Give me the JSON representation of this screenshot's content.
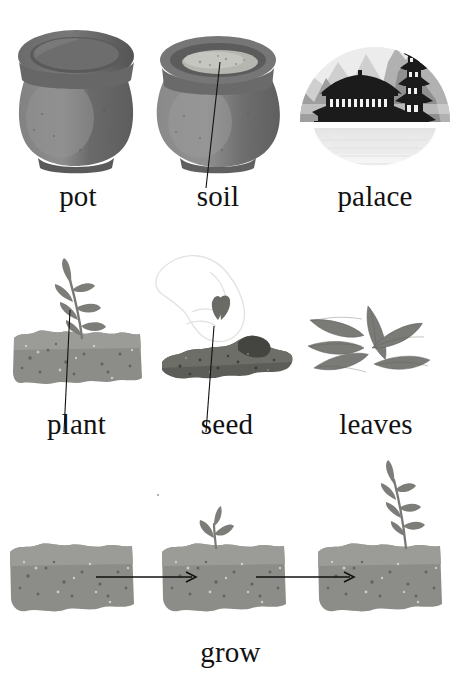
{
  "page": {
    "type": "picture-vocabulary-sheet",
    "background_color": "#ffffff",
    "text_color": "#111111",
    "rows": 3,
    "term_count": 7
  },
  "palette": {
    "soil_light": "#8b8b87",
    "soil_light_top": "#9a9a96",
    "soil_dark": "#585854",
    "soil_dark_top": "#6b6b66",
    "pot_body": "#6f6f6f",
    "pot_body_light": "#848484",
    "pot_rim": "#5e5e5e",
    "pot_rim_dark": "#4f4f4f",
    "pot_inner": "#636363",
    "pot_soil_fill": "#b9b9b4",
    "leaf": "#7a7a76",
    "leaf_dark": "#646460",
    "stem": "#6e6e6a",
    "vignette_bg": "#ededed",
    "mountain_far": "#c9c9c9",
    "mountain_mid": "#a8a8a8",
    "mountain_near": "#8d8d8d",
    "silhouette": "#1c1c1c",
    "window_light": "#f2f2f0",
    "reflection": "#f4f4f4",
    "leader_line": "#111111",
    "arrow": "#111111"
  },
  "rows": [
    {
      "id": "row-1",
      "items": [
        {
          "id": "pot",
          "label": "pot",
          "icon": "clay-pot-icon",
          "has_leader_line": false,
          "description": "empty round clay pot with wide rim"
        },
        {
          "id": "soil",
          "label": "soil",
          "icon": "pot-with-soil-icon",
          "has_leader_line": true,
          "leader_points_to": "soil inside the pot",
          "description": "clay pot filled with pale soil"
        },
        {
          "id": "palace",
          "label": "palace",
          "icon": "palace-icon",
          "has_leader_line": false,
          "description": "circular vignette of an oriental palace and pagoda before misty mountains, mirrored in water"
        }
      ]
    },
    {
      "id": "row-2",
      "items": [
        {
          "id": "plant",
          "label": "plant",
          "icon": "seedling-in-soil-icon",
          "has_leader_line": true,
          "leader_points_to": "the young plant",
          "description": "leafy seedling growing from a block of soil"
        },
        {
          "id": "seed",
          "label": "seed",
          "icon": "hand-dropping-seed-icon",
          "has_leader_line": true,
          "leader_points_to": "the seed being dropped",
          "description": "faint outline of a hand dropping a seed onto dark soil"
        },
        {
          "id": "leaves",
          "label": "leaves",
          "icon": "leaves-icon",
          "has_leader_line": false,
          "description": "six detached leaves arranged in a fan"
        }
      ]
    },
    {
      "id": "row-3",
      "items": [
        {
          "id": "grow",
          "label": "grow",
          "icon": "growth-sequence-icon",
          "has_leader_line": false,
          "description": "three stages of growth linked by two arrows: bare soil, small sprout, tall seedling",
          "sequence": [
            {
              "stage": 1,
              "state": "bare soil",
              "sprout_height": 0
            },
            {
              "stage": 2,
              "state": "small sprout",
              "sprout_height": 26
            },
            {
              "stage": 3,
              "state": "tall seedling",
              "sprout_height": 78
            }
          ],
          "arrows": [
            {
              "from_stage": 1,
              "to_stage": 2,
              "direction": "right"
            },
            {
              "from_stage": 2,
              "to_stage": 3,
              "direction": "right"
            }
          ]
        }
      ]
    }
  ]
}
